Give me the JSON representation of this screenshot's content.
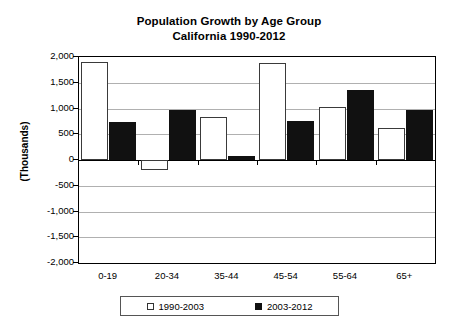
{
  "chart_data": {
    "type": "bar",
    "title": "Population Growth by Age Group",
    "subtitle": "California 1990-2012",
    "xlabel": "",
    "ylabel": "(Thousands)",
    "ylim": [
      -2000,
      2000
    ],
    "ytick_labels": [
      "2,000",
      "1,500",
      "1,000",
      "500",
      "0",
      "-500",
      "-1,000",
      "-1,500",
      "-2,000"
    ],
    "ytick_values": [
      2000,
      1500,
      1000,
      500,
      0,
      -500,
      -1000,
      -1500,
      -2000
    ],
    "grid": true,
    "legend_position": "bottom",
    "categories": [
      "0-19",
      "20-34",
      "35-44",
      "45-54",
      "55-64",
      "65+"
    ],
    "series": [
      {
        "name": "1990-2003",
        "color": "#ffffff",
        "edge_color": "#3a3a3a",
        "values": [
          1910,
          -190,
          840,
          1890,
          1020,
          620
        ]
      },
      {
        "name": "2003-2012",
        "color": "#111111",
        "edge_color": "#111111",
        "values": [
          740,
          980,
          75,
          760,
          1360,
          980
        ]
      }
    ]
  },
  "legend": {
    "items": [
      {
        "label": "1990-2003",
        "swatch": "hollow-square-icon"
      },
      {
        "label": "2003-2012",
        "swatch": "filled-square-icon"
      }
    ]
  }
}
